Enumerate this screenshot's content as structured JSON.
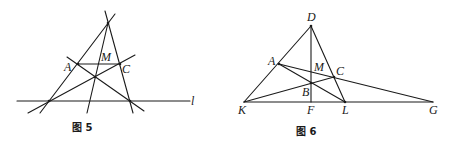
{
  "figures": [
    {
      "id": "fig5",
      "caption": "图 5",
      "labels": {
        "A": "A",
        "M": "M",
        "C": "C",
        "l": "l"
      }
    },
    {
      "id": "fig6",
      "caption": "图 6",
      "labels": {
        "D": "D",
        "A": "A",
        "M": "M",
        "C": "C",
        "B": "B",
        "K": "K",
        "F": "F",
        "L": "L",
        "G": "G"
      }
    }
  ]
}
